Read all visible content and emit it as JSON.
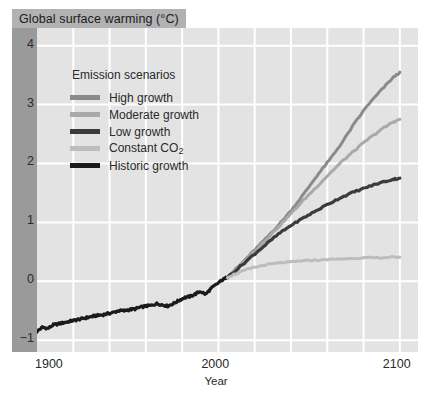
{
  "title": "Global surface warming (°C)",
  "axis": {
    "xlabel": "Year",
    "xticks": [
      "1900",
      "2000",
      "2100"
    ],
    "yticks": [
      "4",
      "3",
      "2",
      "1",
      "0",
      "−1"
    ]
  },
  "legend": {
    "title": "Emission scenarios",
    "items": [
      {
        "label": "High growth",
        "color": "#8a8a8a"
      },
      {
        "label": "Moderate growth",
        "color": "#a9a9a9"
      },
      {
        "label": "Low growth",
        "color": "#3b3b3b"
      },
      {
        "label": "Constant CO",
        "sub": "2",
        "color": "#bdbdbd"
      },
      {
        "label": "Historic growth",
        "color": "#1a1a1a"
      }
    ]
  },
  "colors": {
    "panel_background": "#e3e3e3",
    "gridline": "#ffffff",
    "left_band": "#9a9a9a",
    "title_chip": "#b2b2b2",
    "page_background": "#ffffff"
  },
  "chart_data": {
    "type": "line",
    "title": "Global surface warming (°C)",
    "xlabel": "Year",
    "ylabel": "Global surface warming (°C)",
    "xlim": [
      1900,
      2110
    ],
    "ylim": [
      -1.2,
      4.3
    ],
    "xticks": [
      1900,
      2000,
      2100
    ],
    "yticks": [
      -1,
      0,
      1,
      2,
      3,
      4
    ],
    "grid": true,
    "legend_position": "upper-left-inside",
    "series": [
      {
        "name": "Historic growth",
        "color": "#1a1a1a",
        "x": [
          1900,
          1903,
          1906,
          1909,
          1912,
          1915,
          1918,
          1921,
          1924,
          1927,
          1930,
          1933,
          1936,
          1939,
          1942,
          1945,
          1948,
          1951,
          1954,
          1957,
          1960,
          1963,
          1966,
          1969,
          1972,
          1975,
          1978,
          1981,
          1984,
          1987,
          1990,
          1993,
          1996,
          1999,
          2002,
          2005
        ],
        "y": [
          -0.85,
          -0.78,
          -0.8,
          -0.74,
          -0.72,
          -0.7,
          -0.68,
          -0.66,
          -0.64,
          -0.62,
          -0.6,
          -0.58,
          -0.57,
          -0.55,
          -0.53,
          -0.5,
          -0.5,
          -0.48,
          -0.47,
          -0.44,
          -0.42,
          -0.41,
          -0.38,
          -0.4,
          -0.42,
          -0.38,
          -0.33,
          -0.28,
          -0.26,
          -0.22,
          -0.17,
          -0.22,
          -0.12,
          -0.05,
          0.02,
          0.07
        ]
      },
      {
        "name": "High growth",
        "color": "#8a8a8a",
        "x": [
          2005,
          2012,
          2019,
          2026,
          2033,
          2040,
          2047,
          2054,
          2061,
          2068,
          2075,
          2082,
          2089,
          2096,
          2100
        ],
        "y": [
          0.07,
          0.28,
          0.5,
          0.72,
          0.95,
          1.2,
          1.48,
          1.78,
          2.05,
          2.35,
          2.68,
          2.98,
          3.22,
          3.45,
          3.55
        ]
      },
      {
        "name": "Moderate growth",
        "color": "#a9a9a9",
        "x": [
          2005,
          2012,
          2019,
          2026,
          2033,
          2040,
          2047,
          2054,
          2061,
          2068,
          2075,
          2082,
          2089,
          2096,
          2100
        ],
        "y": [
          0.07,
          0.27,
          0.48,
          0.7,
          0.92,
          1.15,
          1.38,
          1.6,
          1.82,
          2.03,
          2.22,
          2.4,
          2.56,
          2.7,
          2.75
        ]
      },
      {
        "name": "Low growth",
        "color": "#3b3b3b",
        "x": [
          2005,
          2012,
          2019,
          2026,
          2033,
          2040,
          2047,
          2054,
          2061,
          2068,
          2075,
          2082,
          2089,
          2096,
          2100
        ],
        "y": [
          0.07,
          0.25,
          0.44,
          0.62,
          0.8,
          0.95,
          1.08,
          1.2,
          1.32,
          1.43,
          1.52,
          1.6,
          1.67,
          1.73,
          1.75
        ]
      },
      {
        "name": "Constant CO2",
        "color": "#bdbdbd",
        "x": [
          2005,
          2012,
          2019,
          2026,
          2033,
          2040,
          2047,
          2054,
          2061,
          2068,
          2075,
          2082,
          2089,
          2096,
          2100
        ],
        "y": [
          0.07,
          0.16,
          0.23,
          0.28,
          0.31,
          0.33,
          0.35,
          0.36,
          0.37,
          0.38,
          0.39,
          0.4,
          0.4,
          0.41,
          0.41
        ]
      }
    ]
  }
}
